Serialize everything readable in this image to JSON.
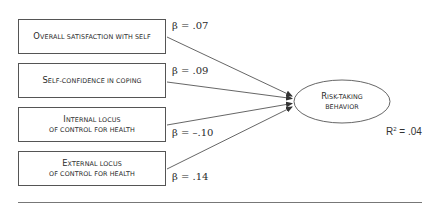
{
  "diagram": {
    "type": "path-model",
    "predictors": [
      {
        "first_cap": "O",
        "rest_line1": "verall satisfaction with self",
        "line2": "",
        "beta": "β = .07"
      },
      {
        "first_cap": "S",
        "rest_line1": "elf-confidence in coping",
        "line2": "",
        "beta": "β = .09"
      },
      {
        "first_cap": "I",
        "rest_line1": "nternal locus",
        "line2": "of control for health",
        "beta": "β = –.10"
      },
      {
        "first_cap": "E",
        "rest_line1": "xternal locus",
        "line2": "of control for health",
        "beta": "β = .14"
      }
    ],
    "outcome": {
      "first_cap": "R",
      "rest_line1": "isk-taking",
      "line2": "behavior"
    },
    "r_squared": {
      "label": "R",
      "sup": "2",
      "value": " = .04"
    },
    "colors": {
      "stroke": "#555555",
      "text": "#2a2a2a",
      "background": "#ffffff"
    }
  }
}
